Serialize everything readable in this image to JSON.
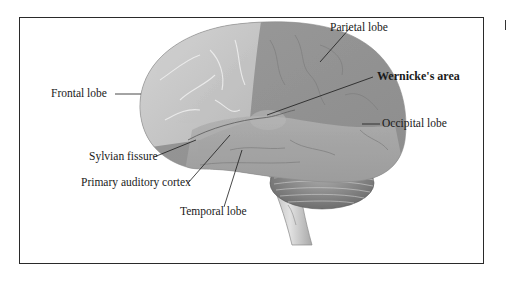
{
  "figure": {
    "type": "lateral view of the brain",
    "labels": {
      "frontal_lobe": "Frontal lobe",
      "parietal_lobe": "Parietal lobe",
      "wernickes_area": "Wernicke's area",
      "occipital_lobe": "Occipital lobe",
      "sylvian_fissure": "Sylvian fissure",
      "primary_auditory_cortex": "Primary auditory cortex",
      "temporal_lobe": "Temporal lobe"
    },
    "emphasized_label": "wernickes_area",
    "colors": {
      "frontal": "#c4c4c4",
      "posterior": "#9e9e9e",
      "temporal": "#a6a6a6",
      "cerebellum": "#8a8a8a",
      "brainstem": "#cfcfcf",
      "frame": "#2a2a2a",
      "leader_line": "#1a1a1a"
    }
  }
}
